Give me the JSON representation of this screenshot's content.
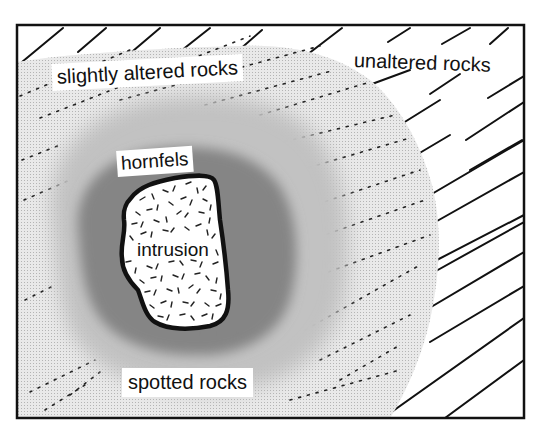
{
  "diagram": {
    "type": "contact-metamorphism-cross-section",
    "frame": {
      "x": 17,
      "y": 25,
      "width": 507,
      "height": 393
    },
    "colors": {
      "line": "#111111",
      "background": "#ffffff",
      "slightly_altered_fill": "#e4e4e4",
      "spotted_fill": "#c6c6c6",
      "hornfels_fill": "#8e8e8e",
      "intrusion_fill": "#ffffff"
    },
    "zones": [
      {
        "id": "unaltered",
        "label": "unaltered rocks",
        "pattern": "solid diagonal bedding lines"
      },
      {
        "id": "slightly_altered",
        "label": "slightly altered rocks",
        "pattern": "light stipple with dotted bedding lines"
      },
      {
        "id": "spotted",
        "label": "spotted rocks",
        "pattern": "medium stipple"
      },
      {
        "id": "hornfels",
        "label": "hornfels",
        "pattern": "dense dark stipple"
      },
      {
        "id": "intrusion",
        "label": "intrusion",
        "pattern": "random short dashes"
      }
    ]
  },
  "labels": {
    "slightly_altered": "slightly altered rocks",
    "unaltered": "unaltered rocks",
    "hornfels": "hornfels",
    "intrusion": "intrusion",
    "spotted": "spotted rocks"
  }
}
